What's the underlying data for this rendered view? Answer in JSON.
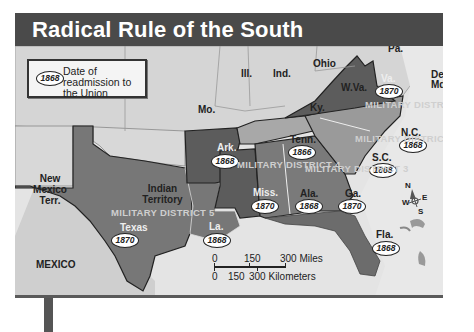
{
  "title": "Radical Rule of the South",
  "legend": {
    "badge": "1868",
    "text": "Date of readmission to the Union"
  },
  "states": {
    "mo": "Mo.",
    "ill": "Ill.",
    "ind": "Ind.",
    "ohio": "Ohio",
    "pa": "Pa.",
    "ky": "Ky.",
    "wva": "W.Va.",
    "del": "Del.",
    "md": "Md.",
    "va": "Va.",
    "nc": "N.C.",
    "sc": "S.C.",
    "tenn": "Tenn.",
    "ark": "Ark.",
    "miss": "Miss.",
    "ala": "Ala.",
    "ga": "Ga.",
    "la": "La.",
    "texas": "Texas",
    "fla": "Fla.",
    "nm": "New Mexico Terr.",
    "indian": "Indian Territory",
    "mexico": "MEXICO"
  },
  "readmission": {
    "va": "1870",
    "nc": "1868",
    "sc": "1868",
    "tenn": "1866",
    "ark": "1868",
    "miss": "1870",
    "ala": "1868",
    "ga": "1870",
    "la": "1868",
    "texas": "1870",
    "fla": "1868"
  },
  "districts": {
    "d1": "MILITARY DISTRICT 1",
    "d2": "MILITARY DISTRICT 2",
    "d3": "MILITARY DISTRICT 3",
    "d4": "MILITARY DISTRICT 4",
    "d5": "MILITARY DISTRICT 5"
  },
  "scale": {
    "miles": [
      "0",
      "150",
      "300 Miles"
    ],
    "km": [
      "0",
      "150",
      "300 Kilometers"
    ]
  },
  "compass": {
    "n": "N",
    "s": "S",
    "e": "E",
    "w": "W"
  },
  "colors": {
    "title_bar": "#4a4a4a",
    "union_states": "#d6d6d6",
    "district_1_4": "#5e5e5e",
    "district_2": "#9a9a9a",
    "district_3_5": "#7c7c7c",
    "water": "#e6e6e6"
  }
}
